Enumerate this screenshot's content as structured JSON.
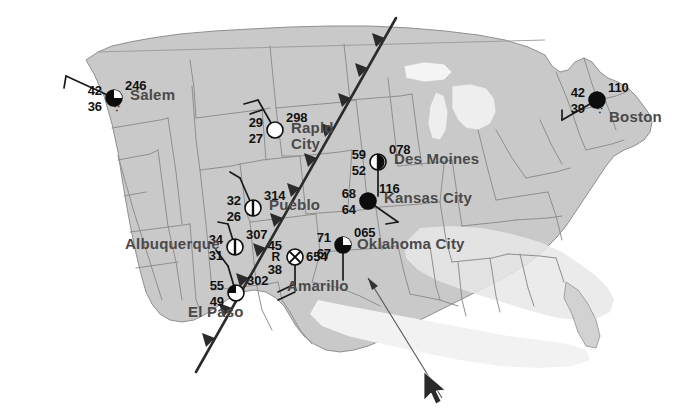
{
  "map": {
    "title": "Surface Weather Map with Station Models",
    "land_color": "#c9c9c9",
    "land_color_light": "#d6d6d6",
    "ocean_color": "#ffffff",
    "border_color": "#8f8f8f",
    "city_label_color": "#5a5a5a",
    "front": {
      "type": "cold-front",
      "color": "#2b2b2b",
      "pip_direction": "west"
    }
  },
  "stations": [
    {
      "id": "salem",
      "name": "Salem",
      "temperature": "42",
      "dewpoint": "36",
      "pressure": "246",
      "present_weather": "∵",
      "sky_cover": "broken",
      "wind_barb": "nw",
      "x": 114,
      "y": 98,
      "label_x": 16,
      "label_y": -12
    },
    {
      "id": "rapid-city",
      "name": "Rapid City",
      "temperature": "29",
      "dewpoint": "27",
      "pressure": "298",
      "present_weather": "",
      "sky_cover": "clear",
      "wind_barb": "nw",
      "x": 275,
      "y": 130,
      "label_x": 16,
      "label_y": -12
    },
    {
      "id": "des-moines",
      "name": "Des Moines",
      "temperature": "59",
      "dewpoint": "52",
      "pressure": "078",
      "present_weather": "",
      "sky_cover": "scattered",
      "wind_barb": "s",
      "x": 378,
      "y": 162,
      "label_x": 16,
      "label_y": -12
    },
    {
      "id": "kansas-city",
      "name": "Kansas City",
      "temperature": "68",
      "dewpoint": "64",
      "pressure": "116",
      "present_weather": "",
      "sky_cover": "overcast",
      "wind_barb": "se",
      "x": 368,
      "y": 201,
      "label_x": 16,
      "label_y": -12
    },
    {
      "id": "boston",
      "name": "Boston",
      "temperature": "42",
      "dewpoint": "39",
      "pressure": "110",
      "present_weather": "∵",
      "sky_cover": "overcast",
      "wind_barb": "sw",
      "x": 597,
      "y": 100,
      "label_x": 12,
      "label_y": 8
    },
    {
      "id": "pueblo",
      "name": "Pueblo",
      "temperature": "32",
      "dewpoint": "26",
      "pressure": "314",
      "present_weather": "",
      "sky_cover": "scattered",
      "wind_barb": "nw",
      "x": 253,
      "y": 208,
      "label_x": 16,
      "label_y": -12
    },
    {
      "id": "albuquerque",
      "name": "Albuquerque",
      "temperature": "34",
      "dewpoint": "31",
      "pressure": "307",
      "present_weather": "",
      "sky_cover": "scattered",
      "wind_barb": "nw",
      "x": 235,
      "y": 247,
      "label_x": -110,
      "label_y": -12
    },
    {
      "id": "el-paso",
      "name": "El Paso",
      "temperature": "55",
      "dewpoint": "49",
      "pressure": "302",
      "present_weather": "",
      "sky_cover": "few",
      "wind_barb": "n",
      "x": 236,
      "y": 293,
      "label_x": -48,
      "label_y": 10
    },
    {
      "id": "amarillo",
      "name": "Amarillo",
      "temperature": "45",
      "dewpoint": "38",
      "pressure": "654",
      "present_weather": "R",
      "sky_cover": "obscured",
      "wind_barb": "s-double",
      "x": 295,
      "y": 257,
      "label_x": -8,
      "label_y": 20
    },
    {
      "id": "oklahoma-city",
      "name": "Oklahoma City",
      "temperature": "71",
      "dewpoint": "67",
      "pressure": "065",
      "present_weather": "",
      "sky_cover": "broken",
      "wind_barb": "s",
      "x": 343,
      "y": 245,
      "label_x": 14,
      "label_y": -10
    }
  ],
  "cursor": {
    "name": "mouse-pointer",
    "x": 428,
    "y": 381
  }
}
